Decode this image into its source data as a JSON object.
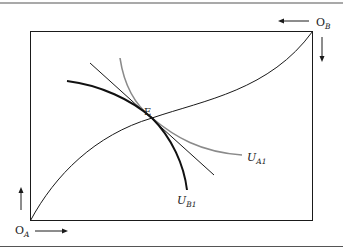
{
  "diagram": {
    "type": "edgeworth-box",
    "labels": {
      "origin_a": "O",
      "origin_a_sub": "A",
      "origin_b": "O",
      "origin_b_sub": "B",
      "equilibrium": "E",
      "u_a1": "U",
      "u_a1_sub": "A1",
      "u_b1": "U",
      "u_b1_sub": "B1"
    },
    "colors": {
      "frame": "#555555",
      "box": "#1a1a1a",
      "contract_curve": "#1a1a1a",
      "u_b1": "#111111",
      "u_a1": "#8a8a8a",
      "tangent": "#1a1a1a"
    }
  }
}
